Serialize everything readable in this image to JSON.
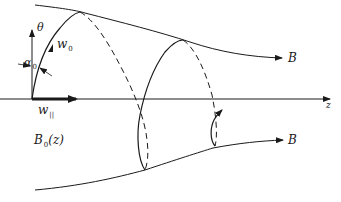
{
  "figure": {
    "labels": {
      "theta": "θ",
      "w0": "w",
      "w0_sub": "0",
      "alpha0": "α",
      "alpha0_sub": "0",
      "w_parallel": "w",
      "w_parallel_sub": "||",
      "z_axis": "z",
      "B_upper": "B",
      "B_lower": "B",
      "B0z": "B",
      "B0z_sub": "0",
      "B0z_arg": "(z)"
    },
    "colors": {
      "ink": "#1a1a1a",
      "background": "#ffffff"
    }
  }
}
